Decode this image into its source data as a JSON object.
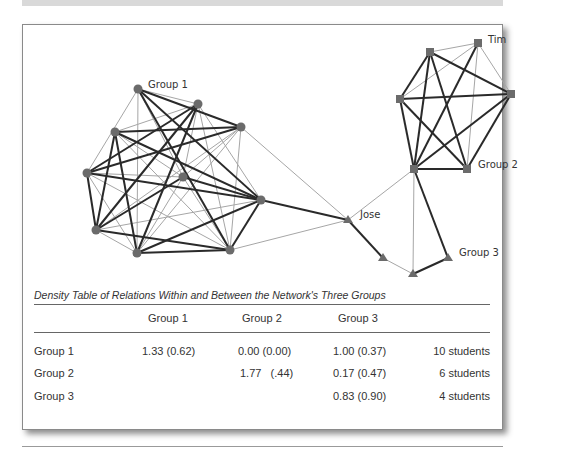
{
  "figure": {
    "group_labels": {
      "group1": "Group 1",
      "group2": "Group 2",
      "group3": "Group 3"
    },
    "named_nodes": {
      "tim": "Tim",
      "jose": "Jose"
    },
    "colors": {
      "node": "#6b6b6b",
      "strong_edge": "#222222",
      "weak_edge": "#a0a0a0"
    }
  },
  "table": {
    "caption": "Density Table of Relations Within and Between the Network's Three Groups",
    "headers": [
      "",
      "Group 1",
      "Group 2",
      "Group 3",
      ""
    ],
    "rows": [
      {
        "label": "Group 1",
        "g1": "1.33 (0.62)",
        "g2": "0.00 (0.00)",
        "g3": "1.00 (0.37)",
        "size": "10 students"
      },
      {
        "label": "Group 2",
        "g1": "",
        "g2": "1.77   (.44)",
        "g3": "0.17 (0.47)",
        "size": "6 students"
      },
      {
        "label": "Group 3",
        "g1": "",
        "g2": "",
        "g3": "0.83 (0.90)",
        "size": "4 students"
      }
    ]
  }
}
